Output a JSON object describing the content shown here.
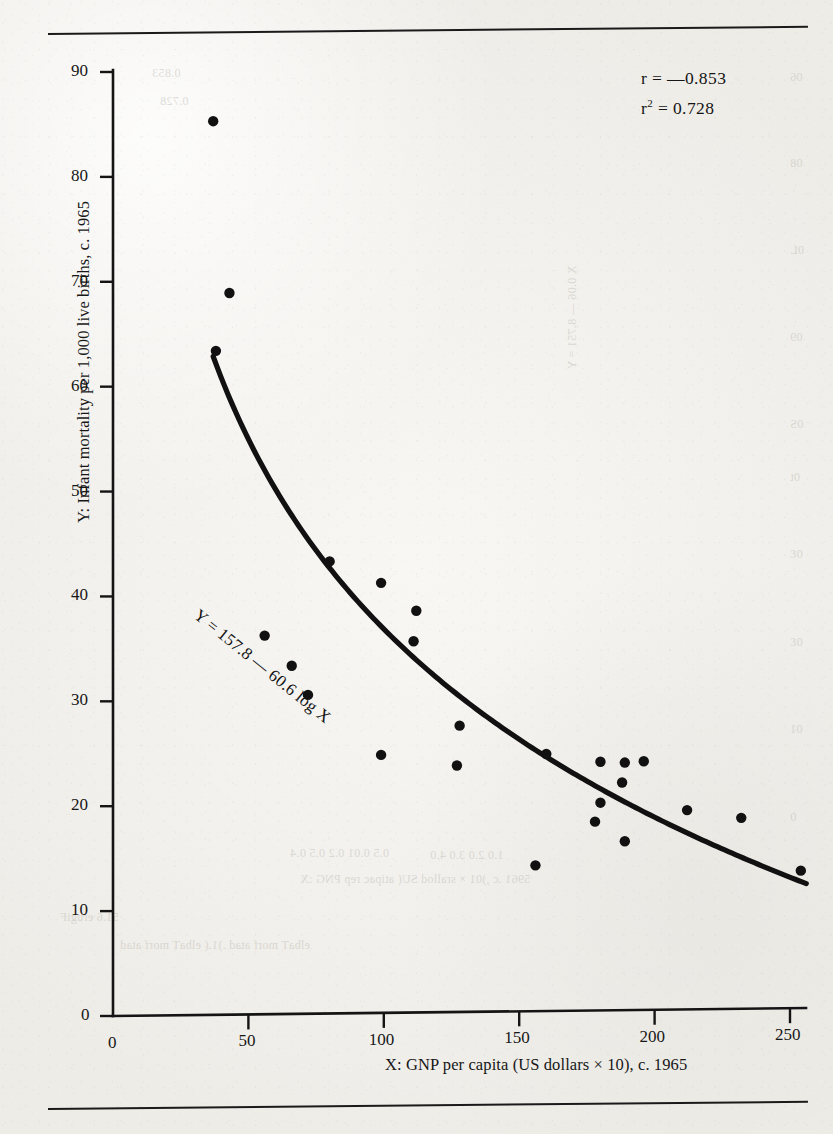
{
  "figure": {
    "y_axis_title": "Y: Infant mortality per 1,000 live births, c. 1965",
    "x_axis_title": "X: GNP per capita (US dollars × 10), c. 1965",
    "correlation_label": "r = —0.853",
    "r_squared_prefix": "r",
    "r_squared_sup": "2",
    "r_squared_value": " = 0.728",
    "equation_label": "Y = 157.8 — 60.6 log X",
    "ink_color": "#141414",
    "paper_color": "#f2f0ec"
  },
  "bleed_through": [
    {
      "text": "0.853",
      "x": 152,
      "y": 66
    },
    {
      "text": "0.728",
      "x": 160,
      "y": 94
    },
    {
      "text": "06",
      "x": 790,
      "y": 70
    },
    {
      "text": "08",
      "x": 790,
      "y": 156
    },
    {
      "text": "0L",
      "x": 790,
      "y": 243
    },
    {
      "text": "09",
      "x": 790,
      "y": 330
    },
    {
      "text": "0S",
      "x": 790,
      "y": 417
    },
    {
      "text": "0t",
      "x": 790,
      "y": 470
    },
    {
      "text": "0Ɛ",
      "x": 790,
      "y": 547
    },
    {
      "text": "0Ɛ",
      "x": 790,
      "y": 635
    },
    {
      "text": "01",
      "x": 790,
      "y": 722
    },
    {
      "text": "0",
      "x": 790,
      "y": 810
    },
    {
      "text": "5961 .c ,shtrib evil 000,1 rep ytilatrom tnafnI :Y",
      "x": 776,
      "y": 110,
      "rotate": true
    },
    {
      "text": "X 0.06 — 8.751 = Y",
      "x": 520,
      "y": 310,
      "rotate": true
    },
    {
      "text": "5961 .c ,)01 × srallod SU( atipac rep PNG :X",
      "x": 300,
      "y": 872
    },
    {
      "text": "0.5       0.01       0.2       0.5       0.4",
      "x": 290,
      "y": 846
    },
    {
      "text": "1.0       2.0       3.0       4.0",
      "x": 430,
      "y": 848
    },
    {
      "text": "51.6 erugiF",
      "x": 60,
      "y": 910
    },
    {
      "text": "elbaT morf atad .)1.( elbaT morf atad",
      "x": 120,
      "y": 938
    }
  ],
  "chart_data": {
    "type": "scatter",
    "title": "",
    "xlabel": "X: GNP per capita (US dollars × 10), c. 1965",
    "ylabel": "Y: Infant mortality per 1,000 live births, c. 1965",
    "xlim": [
      0,
      275
    ],
    "ylim": [
      0,
      90
    ],
    "xticks": [
      0,
      50,
      100,
      150,
      200,
      250
    ],
    "yticks": [
      0,
      10,
      20,
      30,
      40,
      50,
      60,
      70,
      80,
      90
    ],
    "grid": false,
    "legend": null,
    "annotations": [
      {
        "text": "r = —0.853",
        "x": 205,
        "y": 87
      },
      {
        "text": "r² = 0.728",
        "x": 205,
        "y": 84
      },
      {
        "text": "Y = 157.8 — 60.6 log X",
        "x": 52,
        "y": 41,
        "rotation": -39
      }
    ],
    "points": [
      {
        "x": 37,
        "y": 85.2
      },
      {
        "x": 43,
        "y": 68.8
      },
      {
        "x": 38,
        "y": 63.3
      },
      {
        "x": 56,
        "y": 36.1
      },
      {
        "x": 66,
        "y": 33.2
      },
      {
        "x": 72,
        "y": 30.4
      },
      {
        "x": 80,
        "y": 43.1
      },
      {
        "x": 99,
        "y": 41.0
      },
      {
        "x": 112,
        "y": 38.3
      },
      {
        "x": 111,
        "y": 35.4
      },
      {
        "x": 99,
        "y": 24.6
      },
      {
        "x": 128,
        "y": 27.3
      },
      {
        "x": 127,
        "y": 23.5
      },
      {
        "x": 156,
        "y": 13.9
      },
      {
        "x": 160,
        "y": 24.5
      },
      {
        "x": 180,
        "y": 23.7
      },
      {
        "x": 189,
        "y": 23.6
      },
      {
        "x": 196,
        "y": 23.7
      },
      {
        "x": 188,
        "y": 21.7
      },
      {
        "x": 180,
        "y": 19.8
      },
      {
        "x": 178,
        "y": 18.0
      },
      {
        "x": 189,
        "y": 16.1
      },
      {
        "x": 212,
        "y": 19.0
      },
      {
        "x": 232,
        "y": 18.2
      },
      {
        "x": 254,
        "y": 13.1
      }
    ],
    "fit_curve": {
      "equation": "Y = 157.8 — 60.6 log X",
      "intercept": 157.8,
      "slope": -60.6,
      "form": "logarithmic",
      "x_range": [
        37,
        256
      ]
    }
  }
}
